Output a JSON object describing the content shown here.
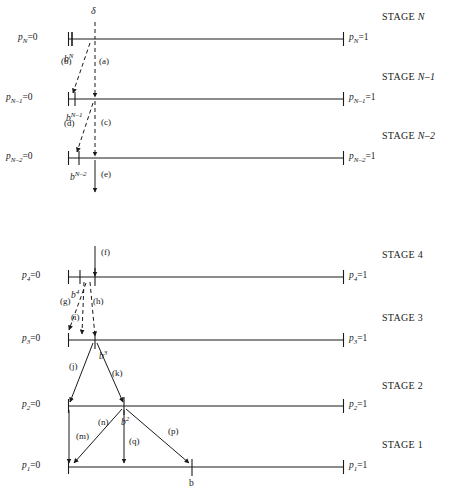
{
  "figure": {
    "kind": "multi-stage number-line diagram",
    "line_color": "#1a1a1a",
    "background": "#ffffff",
    "delta_label": "δ",
    "bottom_b_label": "b"
  },
  "stages": [
    {
      "id": "stage-n",
      "name": "STAGE N",
      "name_prefix": "STAGE ",
      "name_italic": "N",
      "left_label": "p",
      "left_sub": "N",
      "left_value": "=0",
      "right_label": "p",
      "right_sub": "N",
      "right_value": "=1",
      "tick_label": "b",
      "tick_sup": "N"
    },
    {
      "id": "stage-n-1",
      "name": "STAGE N–1",
      "name_prefix": "STAGE ",
      "name_italic": "N–1",
      "left_label": "p",
      "left_sub": "N–1",
      "left_value": "=0",
      "right_label": "p",
      "right_sub": "N–1",
      "right_value": "=1",
      "tick_label": "b",
      "tick_sup": "N–1"
    },
    {
      "id": "stage-n-2",
      "name": "STAGE N–2",
      "name_prefix": "STAGE ",
      "name_italic": "N–2",
      "left_label": "p",
      "left_sub": "N–2",
      "left_value": "=0",
      "right_label": "p",
      "right_sub": "N–2",
      "right_value": "=1",
      "tick_label": "b",
      "tick_sup": "N–2"
    },
    {
      "id": "stage-4",
      "name": "STAGE 4",
      "name_prefix": "STAGE ",
      "name_italic": "4",
      "left_label": "p",
      "left_sub": "4",
      "left_value": "=0",
      "right_label": "p",
      "right_sub": "4",
      "right_value": "=1",
      "tick_label": "b",
      "tick_sup": "4"
    },
    {
      "id": "stage-3",
      "name": "STAGE 3",
      "name_prefix": "STAGE ",
      "name_italic": "3",
      "left_label": "p",
      "left_sub": "3",
      "left_value": "=0",
      "right_label": "p",
      "right_sub": "3",
      "right_value": "=1",
      "tick_label": "b",
      "tick_sup": "3"
    },
    {
      "id": "stage-2",
      "name": "STAGE 2",
      "name_prefix": "STAGE ",
      "name_italic": "2",
      "left_label": "p",
      "left_sub": "2",
      "left_value": "=0",
      "right_label": "p",
      "right_sub": "2",
      "right_value": "=1",
      "tick_label": "b",
      "tick_sup": "2"
    },
    {
      "id": "stage-1",
      "name": "STAGE 1",
      "name_prefix": "STAGE ",
      "name_italic": "1",
      "left_label": "p",
      "left_sub": "1",
      "left_value": "=0",
      "right_label": "p",
      "right_sub": "1",
      "right_value": "=1",
      "tick_label": "b",
      "tick_sup": ""
    }
  ],
  "arrows": [
    {
      "key": "a",
      "label": "(a)",
      "style": "dashed",
      "from_stage": "stage-n",
      "to_stage": "stage-n-1"
    },
    {
      "key": "b",
      "label": "(b)",
      "style": "dashed",
      "from_stage": "stage-n",
      "to_stage": "stage-n-1"
    },
    {
      "key": "c",
      "label": "(c)",
      "style": "dashed",
      "from_stage": "stage-n-1",
      "to_stage": "stage-n-2"
    },
    {
      "key": "d",
      "label": "(d)",
      "style": "dashed",
      "from_stage": "stage-n-1",
      "to_stage": "stage-n-2"
    },
    {
      "key": "e",
      "label": "(e)",
      "style": "solid",
      "from_stage": "stage-n-2",
      "to_stage": "below"
    },
    {
      "key": "f",
      "label": "(f)",
      "style": "solid",
      "from_stage": "above",
      "to_stage": "stage-4"
    },
    {
      "key": "g",
      "label": "(g)",
      "style": "dashed",
      "from_stage": "stage-4",
      "to_stage": "stage-3"
    },
    {
      "key": "h",
      "label": "(h)",
      "style": "dashed",
      "from_stage": "stage-4",
      "to_stage": "stage-3"
    },
    {
      "key": "i",
      "label": "(i)",
      "style": "dashed",
      "from_stage": "stage-4",
      "to_stage": "stage-3"
    },
    {
      "key": "j",
      "label": "(j)",
      "style": "solid",
      "from_stage": "stage-3",
      "to_stage": "stage-2"
    },
    {
      "key": "k",
      "label": "(k)",
      "style": "solid",
      "from_stage": "stage-3",
      "to_stage": "stage-2"
    },
    {
      "key": "m",
      "label": "(m)",
      "style": "solid",
      "from_stage": "stage-2",
      "to_stage": "stage-1"
    },
    {
      "key": "n",
      "label": "(n)",
      "style": "solid",
      "from_stage": "stage-2",
      "to_stage": "stage-1"
    },
    {
      "key": "p",
      "label": "(p)",
      "style": "solid",
      "from_stage": "stage-2",
      "to_stage": "stage-1"
    },
    {
      "key": "q",
      "label": "(q)",
      "style": "solid",
      "from_stage": "stage-2",
      "to_stage": "stage-1"
    }
  ]
}
